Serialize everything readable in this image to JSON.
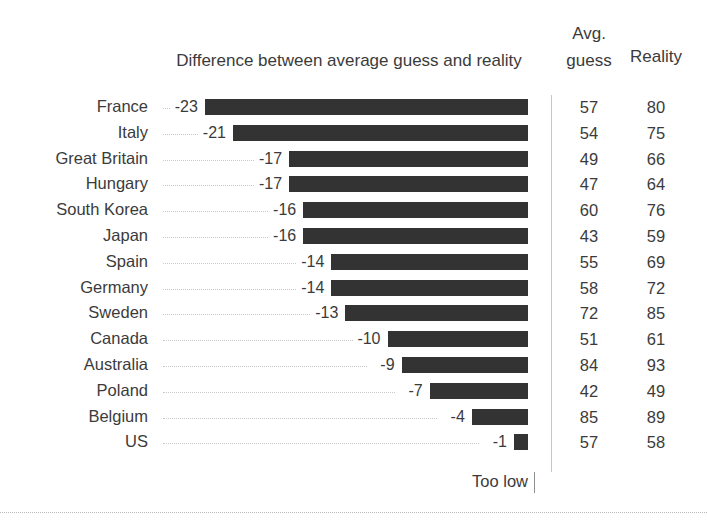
{
  "header": {
    "chart_title": "Difference between average guess and reality",
    "avg_line1": "Avg.",
    "avg_line2": "guess",
    "reality": "Reality"
  },
  "footer": {
    "too_low": "Too low"
  },
  "colors": {
    "bar": "#333333",
    "text": "#3b3b3b",
    "leader": "#c9c9c9",
    "divider": "#c6c6c6"
  },
  "chart_data": {
    "type": "bar",
    "title": "Difference between average guess and reality",
    "xlabel": "",
    "ylabel": "",
    "grid": false,
    "legend": null,
    "orientation": "horizontal",
    "note": "Too low",
    "xlim": [
      -23,
      0
    ],
    "categories": [
      "France",
      "Italy",
      "Great Britain",
      "Hungary",
      "South Korea",
      "Japan",
      "Spain",
      "Germany",
      "Sweden",
      "Canada",
      "Australia",
      "Poland",
      "Belgium",
      "US"
    ],
    "values": [
      -23,
      -21,
      -17,
      -17,
      -16,
      -16,
      -14,
      -14,
      -13,
      -10,
      -9,
      -7,
      -4,
      -1
    ],
    "value_labels": [
      "-23",
      "-21",
      "-17",
      "-17",
      "-16",
      "-16",
      "-14",
      "-14",
      "-13",
      "-10",
      "-9",
      "-7",
      "-4",
      "-1"
    ],
    "series": [
      {
        "name": "Difference between average guess and reality",
        "values": [
          -23,
          -21,
          -17,
          -17,
          -16,
          -16,
          -14,
          -14,
          -13,
          -10,
          -9,
          -7,
          -4,
          -1
        ]
      },
      {
        "name": "Avg. guess",
        "values": [
          57,
          54,
          49,
          47,
          60,
          43,
          55,
          58,
          72,
          51,
          84,
          42,
          85,
          57
        ]
      },
      {
        "name": "Reality",
        "values": [
          80,
          75,
          66,
          64,
          76,
          59,
          69,
          72,
          85,
          61,
          93,
          49,
          89,
          58
        ]
      }
    ],
    "rows": [
      {
        "country": "France",
        "diff": "-23",
        "guess": "57",
        "reality": "80"
      },
      {
        "country": "Italy",
        "diff": "-21",
        "guess": "54",
        "reality": "75"
      },
      {
        "country": "Great Britain",
        "diff": "-17",
        "guess": "49",
        "reality": "66"
      },
      {
        "country": "Hungary",
        "diff": "-17",
        "guess": "47",
        "reality": "64"
      },
      {
        "country": "South Korea",
        "diff": "-16",
        "guess": "60",
        "reality": "76"
      },
      {
        "country": "Japan",
        "diff": "-16",
        "guess": "43",
        "reality": "59"
      },
      {
        "country": "Spain",
        "diff": "-14",
        "guess": "55",
        "reality": "69"
      },
      {
        "country": "Germany",
        "diff": "-14",
        "guess": "58",
        "reality": "72"
      },
      {
        "country": "Sweden",
        "diff": "-13",
        "guess": "72",
        "reality": "85"
      },
      {
        "country": "Canada",
        "diff": "-10",
        "guess": "51",
        "reality": "61"
      },
      {
        "country": "Australia",
        "diff": "-9",
        "guess": "84",
        "reality": "93"
      },
      {
        "country": "Poland",
        "diff": "-7",
        "guess": "42",
        "reality": "49"
      },
      {
        "country": "Belgium",
        "diff": "-4",
        "guess": "85",
        "reality": "89"
      },
      {
        "country": "US",
        "diff": "-1",
        "guess": "57",
        "reality": "58"
      }
    ]
  }
}
